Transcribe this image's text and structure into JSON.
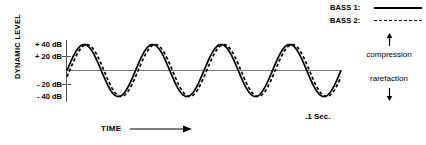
{
  "figure": {
    "axis_title_y": "DYNAMIC LEVEL",
    "axis_title_x": "TIME",
    "duration_label": ".1 Sec.",
    "compression_label": "compression",
    "rarefaction_label": "rarefaction",
    "up_arrow_icon": "arrow-up-icon",
    "down_arrow_icon": "arrow-down-icon",
    "time_arrow_icon": "arrow-right-icon"
  },
  "legend": {
    "items": [
      {
        "label": "BASS 1:",
        "style": "solid",
        "color": "#000000"
      },
      {
        "label": "BASS 2:",
        "style": "dashed",
        "color": "#000000"
      }
    ]
  },
  "y_axis": {
    "ticks": [
      {
        "label": "+ 40 dB",
        "value": 40
      },
      {
        "label": "+ 20 dB",
        "value": 20
      },
      {
        "label": "- 20 dB",
        "value": -20
      },
      {
        "label": "- 40 dB",
        "value": -40
      }
    ]
  },
  "chart_data": {
    "type": "line",
    "title": "",
    "xlabel": "TIME",
    "ylabel": "DYNAMIC LEVEL",
    "ylim": [
      -45,
      45
    ],
    "xlim": [
      0,
      0.1
    ],
    "grid": false,
    "legend_position": "top-right",
    "x_tick_labels": [
      ".1 Sec."
    ],
    "y_tick_labels": [
      "+ 40 dB",
      "+ 20 dB",
      "- 20 dB",
      "- 40 dB"
    ],
    "annotations": [
      "compression",
      "rarefaction"
    ],
    "waveform": {
      "cycles": 4,
      "amplitude_db": 40,
      "period_sec": 0.025,
      "total_sec": 0.1
    },
    "series": [
      {
        "name": "BASS 1:",
        "style": "solid",
        "color": "#000000",
        "amplitude": 40,
        "cycles": 4,
        "phase_deg": 0
      },
      {
        "name": "BASS 2:",
        "style": "dashed",
        "color": "#000000",
        "amplitude": 40,
        "cycles": 4,
        "phase_deg": -14
      }
    ]
  }
}
